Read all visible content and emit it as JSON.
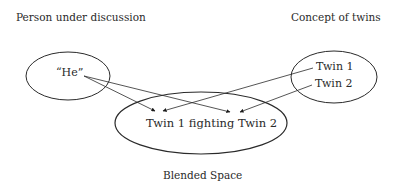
{
  "diagram": {
    "input_left": {
      "heading": "Person under discussion",
      "element": "“He”"
    },
    "input_right": {
      "heading": "Concept of twins",
      "elements": [
        "Twin 1",
        "Twin 2"
      ]
    },
    "blend": {
      "content": "Twin 1 fighting Twin 2",
      "caption": "Blended Space"
    },
    "mappings": [
      {
        "from": "“He”",
        "to": "Twin 1 (blend)"
      },
      {
        "from": "“He”",
        "to": "Twin 2 (blend)"
      },
      {
        "from": "Twin 1",
        "to": "Twin 1 (blend)"
      },
      {
        "from": "Twin 2",
        "to": "Twin 2 (blend)"
      }
    ],
    "colors": {
      "stroke": "#2a2a2a",
      "text": "#2a2a2a",
      "background": "#ffffff"
    }
  }
}
